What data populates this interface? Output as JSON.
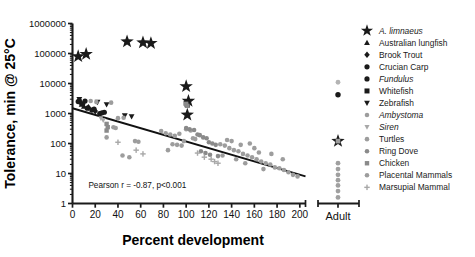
{
  "chart_data": {
    "type": "scatter",
    "title": "",
    "xlabel": "Percent development",
    "ylabel": "Tolerance, min @ 25°C",
    "xlim": [
      0,
      205
    ],
    "ylim": [
      1,
      1000000
    ],
    "yscale": "log",
    "xscale": "linear",
    "grid": false,
    "xticks": [
      0,
      20,
      40,
      60,
      80,
      100,
      120,
      140,
      160,
      180,
      200
    ],
    "xticklabels": [
      "0",
      "20",
      "40",
      "60",
      "80",
      "100",
      "120",
      "140",
      "160",
      "180",
      "200"
    ],
    "yticks": [
      1,
      10,
      100,
      1000,
      10000,
      100000,
      1000000
    ],
    "yticklabels": [
      "1",
      "10",
      "100",
      "1000",
      "10000",
      "100000",
      "1000000"
    ],
    "minor_ticks": true,
    "annotations": [
      {
        "text": "Pearson r = -0.87, p<0.001",
        "x": 14,
        "y": 3.2
      }
    ],
    "extra_category_axis": {
      "label": "Adult",
      "position": "right-of-main"
    },
    "trendline": {
      "label": "linear regression (log y)",
      "x_start": 0,
      "y_start": 1500,
      "x_end": 205,
      "y_end": 8,
      "color": "#111111"
    },
    "legend": {
      "position": "right",
      "entries": [
        {
          "label": "A. limnaeus",
          "marker": "star",
          "color": "#1a1a1a",
          "italic": true
        },
        {
          "label": "Australian lungfish",
          "marker": "triangle-up",
          "color": "#1a1a1a",
          "italic": false
        },
        {
          "label": "Brook Trout",
          "marker": "diamond",
          "color": "#1a1a1a",
          "italic": false
        },
        {
          "label": "Crucian Carp",
          "marker": "circle",
          "color": "#1a1a1a",
          "italic": false
        },
        {
          "label": "Fundulus",
          "marker": "circle",
          "color": "#1a1a1a",
          "italic": true
        },
        {
          "label": "Whitefish",
          "marker": "square",
          "color": "#1a1a1a",
          "italic": false
        },
        {
          "label": "Zebrafish",
          "marker": "triangle-down",
          "color": "#1a1a1a",
          "italic": false
        },
        {
          "label": "Ambystoma",
          "marker": "circle",
          "color": "#9d9d9d",
          "italic": true
        },
        {
          "label": "Siren",
          "marker": "triangle-down",
          "color": "#a8a8a8",
          "italic": true
        },
        {
          "label": "Turtles",
          "marker": "circle",
          "color": "#9d9d9d",
          "italic": false
        },
        {
          "label": "Ring Dove",
          "marker": "circle",
          "color": "#8a8a8a",
          "italic": false
        },
        {
          "label": "Chicken",
          "marker": "square",
          "color": "#8a8a8a",
          "italic": false
        },
        {
          "label": "Placental Mammals",
          "marker": "circle",
          "color": "#9d9d9d",
          "italic": false
        },
        {
          "label": "Marsupial Mammal",
          "marker": "plus",
          "color": "#a8a8a8",
          "italic": false
        }
      ]
    },
    "series": [
      {
        "name": "A. limnaeus",
        "marker": "star",
        "color": "#1a1a1a",
        "points": [
          [
            5,
            80000
          ],
          [
            12,
            95000
          ],
          [
            48,
            250000
          ],
          [
            62,
            230000
          ],
          [
            69,
            220000
          ],
          [
            100,
            8000
          ],
          [
            102,
            2600
          ],
          [
            101,
            900
          ]
        ]
      },
      {
        "name": "Australian lungfish",
        "marker": "triangle-up",
        "color": "#1a1a1a",
        "points": [
          [
            8,
            2000
          ],
          [
            10,
            1700
          ]
        ]
      },
      {
        "name": "Brook Trout",
        "marker": "diamond",
        "color": "#1a1a1a",
        "points": [
          [
            7,
            2300
          ],
          [
            14,
            1600
          ],
          [
            20,
            1200
          ]
        ]
      },
      {
        "name": "Crucian Carp",
        "marker": "circle",
        "color": "#1a1a1a",
        "points": [
          [
            6,
            2700
          ],
          [
            9,
            2100
          ],
          [
            13,
            1500
          ],
          [
            17,
            1300
          ],
          [
            24,
            1000
          ],
          [
            28,
            1100
          ]
        ]
      },
      {
        "name": "Fundulus",
        "marker": "circle",
        "color": "#1a1a1a",
        "points": [
          [
            5,
            2500
          ],
          [
            11,
            2600
          ],
          [
            19,
            1400
          ],
          [
            26,
            1050
          ]
        ]
      },
      {
        "name": "Whitefish",
        "marker": "square",
        "color": "#1a1a1a",
        "points": [
          [
            100,
            2200
          ],
          [
            101,
            1900
          ]
        ]
      },
      {
        "name": "Zebrafish",
        "marker": "triangle-down",
        "color": "#1a1a1a",
        "points": [
          [
            6,
            3000
          ],
          [
            22,
            2400
          ],
          [
            30,
            2000
          ],
          [
            46,
            850
          ],
          [
            52,
            800
          ]
        ]
      },
      {
        "name": "Ambystoma",
        "marker": "circle",
        "color": "#9d9d9d",
        "points": [
          [
            16,
            2600
          ],
          [
            21,
            2400
          ],
          [
            34,
            2300
          ],
          [
            40,
            700
          ],
          [
            45,
            720
          ],
          [
            36,
            350
          ],
          [
            38,
            330
          ],
          [
            30,
            160
          ],
          [
            55,
            120
          ],
          [
            58,
            115
          ],
          [
            44,
            40
          ],
          [
            50,
            35
          ]
        ]
      },
      {
        "name": "Siren",
        "marker": "triangle-down",
        "color": "#a8a8a8",
        "points": [
          [
            25,
            700
          ],
          [
            27,
            600
          ]
        ]
      },
      {
        "name": "Turtles",
        "marker": "circle",
        "color": "#9d9d9d",
        "points": [
          [
            78,
            260
          ],
          [
            82,
            220
          ],
          [
            86,
            200
          ],
          [
            90,
            180
          ],
          [
            94,
            210
          ],
          [
            88,
            95
          ],
          [
            92,
            90
          ],
          [
            96,
            85
          ],
          [
            84,
            60
          ],
          [
            98,
            120
          ],
          [
            100,
            300
          ],
          [
            104,
            270
          ],
          [
            106,
            150
          ],
          [
            108,
            140
          ]
        ]
      },
      {
        "name": "Ring Dove",
        "marker": "circle",
        "color": "#8a8a8a",
        "points": [
          [
            100,
            330
          ],
          [
            103,
            300
          ],
          [
            107,
            280
          ],
          [
            110,
            200
          ],
          [
            112,
            190
          ],
          [
            115,
            160
          ],
          [
            118,
            150
          ],
          [
            120,
            110
          ],
          [
            123,
            100
          ],
          [
            126,
            90
          ],
          [
            113,
            55
          ],
          [
            117,
            48
          ],
          [
            121,
            42
          ],
          [
            128,
            38
          ]
        ]
      },
      {
        "name": "Chicken",
        "marker": "square",
        "color": "#8a8a8a",
        "points": [
          [
            100,
            2100
          ],
          [
            101,
            1800
          ],
          [
            30,
            450
          ],
          [
            31,
            350
          ],
          [
            30,
            270
          ]
        ]
      },
      {
        "name": "Placental Mammals",
        "marker": "circle",
        "color": "#9d9d9d",
        "points": [
          [
            130,
            95
          ],
          [
            134,
            85
          ],
          [
            138,
            70
          ],
          [
            142,
            60
          ],
          [
            146,
            55
          ],
          [
            150,
            45
          ],
          [
            154,
            40
          ],
          [
            158,
            35
          ],
          [
            162,
            30
          ],
          [
            166,
            25
          ],
          [
            170,
            22
          ],
          [
            174,
            20
          ],
          [
            178,
            16
          ],
          [
            182,
            15
          ],
          [
            186,
            13
          ],
          [
            190,
            11
          ],
          [
            194,
            9
          ],
          [
            198,
            8
          ],
          [
            140,
            120
          ],
          [
            160,
            70
          ],
          [
            175,
            45
          ],
          [
            185,
            30
          ],
          [
            152,
            22
          ],
          [
            168,
            14
          ],
          [
            144,
            30
          ],
          [
            132,
            40
          ],
          [
            136,
            130
          ],
          [
            148,
            90
          ],
          [
            156,
            100
          ],
          [
            164,
            50
          ]
        ]
      },
      {
        "name": "Marsupial Mammal",
        "marker": "plus",
        "color": "#a8a8a8",
        "points": [
          [
            40,
            110
          ],
          [
            56,
            60
          ],
          [
            62,
            45
          ],
          [
            110,
            48
          ],
          [
            116,
            35
          ],
          [
            122,
            30
          ],
          [
            125,
            25
          ],
          [
            128,
            22
          ]
        ]
      }
    ],
    "adult_points": [
      {
        "y": 11000,
        "marker": "circle",
        "color": "#b4b4b4"
      },
      {
        "y": 4200,
        "marker": "circle",
        "color": "#1a1a1a"
      },
      {
        "y": 120,
        "marker": "star",
        "color": "#1a1a1a"
      },
      {
        "y": 120,
        "marker": "square",
        "color": "#9d9d9d"
      },
      {
        "y": 22,
        "marker": "circle",
        "color": "#a0a0a0"
      },
      {
        "y": 14,
        "marker": "circle",
        "color": "#a0a0a0"
      },
      {
        "y": 9,
        "marker": "circle",
        "color": "#a0a0a0"
      },
      {
        "y": 6,
        "marker": "circle",
        "color": "#a0a0a0"
      },
      {
        "y": 4,
        "marker": "circle",
        "color": "#a0a0a0"
      },
      {
        "y": 2.6,
        "marker": "circle",
        "color": "#a0a0a0"
      },
      {
        "y": 1.6,
        "marker": "circle",
        "color": "#a0a0a0"
      }
    ]
  }
}
